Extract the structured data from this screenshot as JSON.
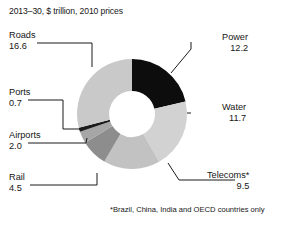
{
  "chart_data": {
    "type": "pie",
    "variant": "donut",
    "title": "2013–30, $ trillion, 2010 prices",
    "footnote": "*Brazil, China, India and OECD countries only",
    "unit": "$ trillion, 2010 prices",
    "period": "2013–30",
    "total": 57.2,
    "start_angle_deg": 0,
    "direction": "clockwise",
    "legend": "none",
    "grid": false,
    "categories": [
      "Power",
      "Water",
      "Telecoms*",
      "Rail",
      "Airports",
      "Ports",
      "Roads"
    ],
    "values": [
      12.2,
      11.7,
      9.5,
      4.5,
      2.0,
      0.7,
      16.6
    ],
    "colors": [
      "#0d0d0d",
      "#d2d2d2",
      "#c2c2c2",
      "#8d8d8d",
      "#a6a6a6",
      "#1c1c1c",
      "#c9c9c9"
    ],
    "slices": [
      {
        "label": "Power",
        "value": 12.2,
        "value_text": "12.2",
        "color": "#0d0d0d",
        "label_side": "right"
      },
      {
        "label": "Water",
        "value": 11.7,
        "value_text": "11.7",
        "color": "#d2d2d2",
        "label_side": "right"
      },
      {
        "label": "Telecoms*",
        "value": 9.5,
        "value_text": "9.5",
        "color": "#c2c2c2",
        "label_side": "right"
      },
      {
        "label": "Rail",
        "value": 4.5,
        "value_text": "4.5",
        "color": "#8d8d8d",
        "label_side": "left"
      },
      {
        "label": "Airports",
        "value": 2.0,
        "value_text": "2.0",
        "color": "#a6a6a6",
        "label_side": "left"
      },
      {
        "label": "Ports",
        "value": 0.7,
        "value_text": "0.7",
        "color": "#1c1c1c",
        "label_side": "left"
      },
      {
        "label": "Roads",
        "value": 16.6,
        "value_text": "16.6",
        "color": "#c9c9c9",
        "label_side": "left"
      }
    ]
  },
  "labels": {
    "power": {
      "cat": "Power",
      "val": "12.2"
    },
    "water": {
      "cat": "Water",
      "val": "11.7"
    },
    "telecoms": {
      "cat": "Telecoms*",
      "val": "9.5"
    },
    "rail": {
      "cat": "Rail",
      "val": "4.5"
    },
    "airports": {
      "cat": "Airports",
      "val": "2.0"
    },
    "ports": {
      "cat": "Ports",
      "val": "0.7"
    },
    "roads": {
      "cat": "Roads",
      "val": "16.6"
    }
  }
}
